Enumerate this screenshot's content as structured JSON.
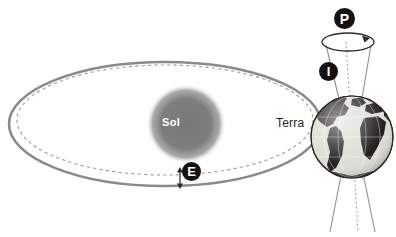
{
  "diagram": {
    "background_color": "#ffffff"
  },
  "labels": {
    "sun": "Sol",
    "earth": "Terra"
  },
  "markers": [
    {
      "id": "precession",
      "label": "P",
      "meaning": "precession",
      "x": 344,
      "y": 18
    },
    {
      "id": "obliquity",
      "label": "I",
      "meaning": "inclination / obliquity",
      "x": 328,
      "y": 71
    },
    {
      "id": "eccentricity",
      "label": "E",
      "meaning": "eccentricity",
      "x": 191,
      "y": 171
    }
  ],
  "colors": {
    "orbit_solid": "#8a8a88",
    "orbit_dashed": "#9a9a98",
    "sun_fill": "#7d7d7d",
    "badge_fill": "#141110",
    "badge_text": "#ffffff",
    "earth_land": "#231f1e",
    "earth_ocean": "#dcdcd6",
    "axis_line": "#8e8e8c",
    "label_text": "#231f1e"
  },
  "geometry": {
    "orbit_solid_ellipse": {
      "cx": 165,
      "cy": 124,
      "rx": 156,
      "ry": 62
    },
    "orbit_dashed_ellipse": {
      "cx": 165,
      "cy": 120,
      "rx": 148,
      "ry": 55
    },
    "sun": {
      "cx": 186,
      "cy": 124,
      "r": 37
    },
    "earth": {
      "cx": 352,
      "cy": 137,
      "r": 41
    },
    "precession_circle": {
      "cx": 348,
      "cy": 42,
      "rx": 26,
      "ry": 9
    },
    "axis_tilt_degrees": 12
  },
  "annotations": {
    "eccentricity_arrow": "double-headed vertical arrow between dashed and solid orbit",
    "precession_arrow": "arrowhead indicating rotation around precession circle"
  }
}
